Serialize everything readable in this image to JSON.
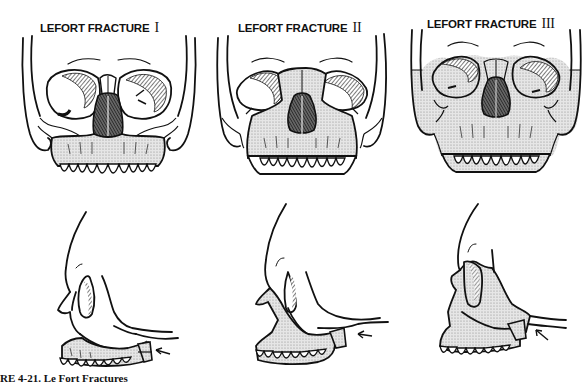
{
  "figure": {
    "panels": [
      {
        "title": "LEFORT FRACTURE",
        "numeral": "I",
        "front_view": "frontal-skull",
        "lateral_view": "lateral-skull",
        "level": 1
      },
      {
        "title": "LEFORT FRACTURE",
        "numeral": "II",
        "front_view": "frontal-skull",
        "lateral_view": "lateral-skull",
        "level": 2
      },
      {
        "title": "LEFORT FRACTURE",
        "numeral": "III",
        "front_view": "frontal-skull",
        "lateral_view": "lateral-skull",
        "level": 3
      }
    ],
    "caption": "URE 4-21. Le Fort Fractures"
  },
  "colors": {
    "line": "#111111",
    "shade": "#d4d4d4",
    "dark_shade": "#555555",
    "background": "#ffffff"
  }
}
